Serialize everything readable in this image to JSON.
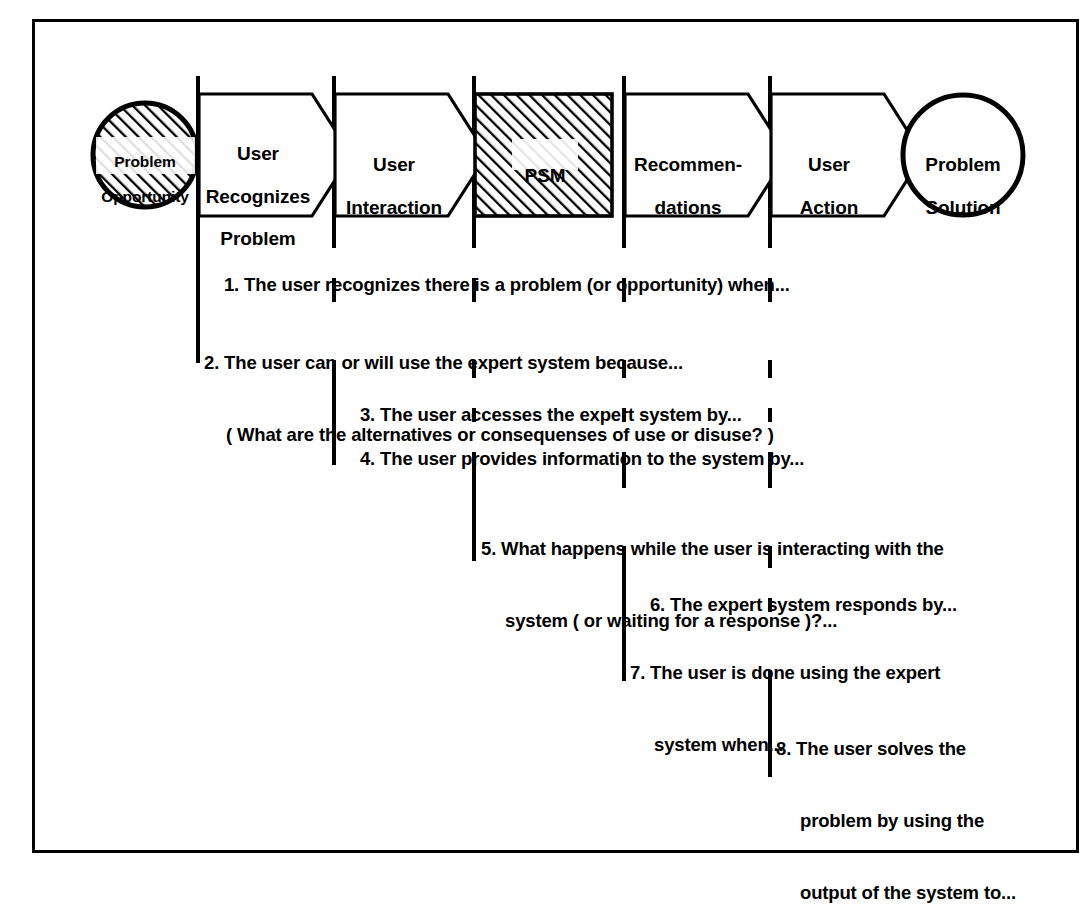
{
  "diagram": {
    "title_present": false,
    "colors": {
      "line": "#000000",
      "background": "#ffffff",
      "hatch": "#000000"
    },
    "nodes": [
      {
        "id": "problem-opportunity",
        "shape": "circle-hatched",
        "label": "Problem\nOpportunity"
      },
      {
        "id": "user-recognizes-problem",
        "shape": "chevron",
        "label": "User\nRecognizes\nProblem"
      },
      {
        "id": "user-interaction",
        "shape": "chevron",
        "label": "User\nInteraction"
      },
      {
        "id": "psm",
        "shape": "rectangle-hatched",
        "label": "PSM"
      },
      {
        "id": "recommendations",
        "shape": "chevron",
        "label": "Recommen-\ndations"
      },
      {
        "id": "user-action",
        "shape": "chevron",
        "label": "User\nAction"
      },
      {
        "id": "problem-solution",
        "shape": "circle",
        "label": "Problem\nSolution"
      }
    ],
    "steps": [
      {
        "number": "1.",
        "lines": [
          "The user recognizes there is a problem (or opportunity) when..."
        ]
      },
      {
        "number": "2.",
        "lines": [
          "The user can or will use the expert system because...",
          "( What are the alternatives or consequenses of use or disuse? )"
        ]
      },
      {
        "number": "3.",
        "lines": [
          "The user accesses the expert system by..."
        ]
      },
      {
        "number": "4.",
        "lines": [
          "The user provides information to the system by..."
        ]
      },
      {
        "number": "5.",
        "lines": [
          "What happens while the user is interacting with the",
          "system ( or waiting for a response )?..."
        ]
      },
      {
        "number": "6.",
        "lines": [
          "The expert system responds by..."
        ]
      },
      {
        "number": "7.",
        "lines": [
          "The user is done using the expert",
          "system when..."
        ]
      },
      {
        "number": "8.",
        "lines": [
          "The user solves the",
          "problem by using the",
          "output of the system to..."
        ]
      }
    ],
    "step_text": {
      "s1": "1. The user recognizes there is a problem (or opportunity) when...",
      "s2a": "2. The user can or will use the expert system because...",
      "s2b": "( What are the alternatives or consequenses of use or disuse? )",
      "s3": "3. The user accesses the expert system by...",
      "s4": "4. The user provides information to the system by...",
      "s5a": "5. What happens while the user is interacting with the",
      "s5b": "system ( or waiting for a response )?...",
      "s6": "6. The expert system responds by...",
      "s7a": "7. The user is done using the expert",
      "s7b": "system when...",
      "s8a": "8. The user solves the",
      "s8b": "problem by using the",
      "s8c": "output of the system to..."
    },
    "labels": {
      "problem_opportunity_l1": "Problem",
      "problem_opportunity_l2": "Opportunity",
      "user_recognizes_l1": "User",
      "user_recognizes_l2": "Recognizes",
      "user_recognizes_l3": "Problem",
      "user_interaction_l1": "User",
      "user_interaction_l2": "Interaction",
      "psm": "PSM",
      "recommendations_l1": "Recommen-",
      "recommendations_l2": "dations",
      "user_action_l1": "User",
      "user_action_l2": "Action",
      "problem_solution_l1": "Problem",
      "problem_solution_l2": "Solution"
    }
  }
}
